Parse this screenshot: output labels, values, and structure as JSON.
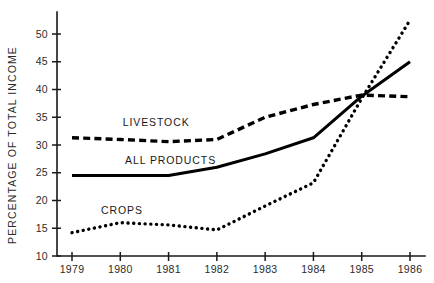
{
  "chart_data": {
    "type": "line",
    "title": "",
    "subtitle": "",
    "xlabel": "",
    "ylabel": "PERCENTAGE OF TOTAL INCOME",
    "x": [
      1979,
      1980,
      1981,
      1982,
      1983,
      1984,
      1985,
      1986
    ],
    "categories": [
      "1979",
      "1980",
      "1981",
      "1982",
      "1983",
      "1984",
      "1985",
      "1986"
    ],
    "xlim": [
      1979,
      1986
    ],
    "ylim": [
      10,
      53
    ],
    "yticks": [
      10,
      15,
      20,
      25,
      30,
      35,
      40,
      45,
      50
    ],
    "ytick_labels": [
      "10",
      "15",
      "20",
      "25",
      "30",
      "35",
      "40",
      "45",
      "50"
    ],
    "grid": false,
    "legend_position": "inline-annotations",
    "series": [
      {
        "name": "LIVESTOCK",
        "style": "dashed",
        "color": "#000000",
        "values": [
          31.3,
          31.0,
          30.6,
          31.0,
          35.0,
          37.3,
          39.0,
          38.7
        ],
        "label": "LIVESTOCK",
        "label_x": 1980.05,
        "label_y": 33.4
      },
      {
        "name": "ALL PRODUCTS",
        "style": "solid",
        "color": "#000000",
        "values": [
          24.5,
          24.5,
          24.5,
          26.0,
          28.4,
          31.3,
          38.8,
          45.0
        ],
        "label": "ALL PRODUCTS",
        "label_x": 1980.1,
        "label_y": 26.6
      },
      {
        "name": "CROPS",
        "style": "dotted",
        "color": "#000000",
        "values": [
          14.2,
          16.0,
          15.6,
          14.7,
          19.0,
          23.2,
          38.4,
          52.5
        ],
        "label": "CROPS",
        "label_x": 1979.6,
        "label_y": 17.6
      }
    ]
  },
  "axis": {
    "ylabel": "PERCENTAGE OF TOTAL INCOME"
  }
}
